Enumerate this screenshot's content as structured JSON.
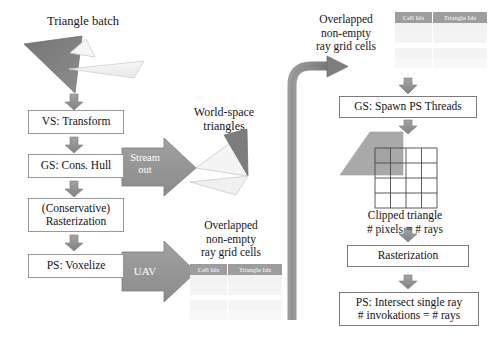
{
  "figure": {
    "title_left": "Triangle batch",
    "label_world_space": "World-space\ntriangles",
    "label_overlapped_bottom": "Overlapped\nnon-empty\nray grid cells",
    "label_overlapped_top": "Overlapped\nnon-empty\nray grid cells",
    "label_clipped": "Clipped triangle\n# pixels = # rays"
  },
  "left_pipeline": {
    "stages": [
      {
        "id": "vs-transform",
        "text": "VS: Transform"
      },
      {
        "id": "gs-cons-hull",
        "text": "GS: Cons. Hull"
      },
      {
        "id": "conservative-rasterization",
        "text": "(Conservative)\nRasterization"
      },
      {
        "id": "ps-voxelize",
        "text": "PS: Voxelize"
      }
    ]
  },
  "right_pipeline": {
    "stages": [
      {
        "id": "gs-spawn-ps-threads",
        "text": "GS: Spawn PS Threads"
      },
      {
        "id": "rasterization",
        "text": "Rasterization"
      },
      {
        "id": "ps-intersect-single-ray",
        "text": "PS: Intersect single ray\n# invokations = # rays"
      }
    ]
  },
  "block_arrows": {
    "stream_out": "Stream\nout",
    "uav": "UAV"
  },
  "tables": {
    "columns": [
      "Cell Idx",
      "Triangle Idx"
    ]
  },
  "colors": {
    "arrow_fill": "#8c8c8c",
    "arrow_stroke": "#6e6e6e",
    "block_arrow_fill": "#949494",
    "box_border": "#9a9a9a",
    "triangle_dark": "#6b6b6b",
    "triangle_mid": "#a8a8a8",
    "triangle_light": "#f2f2f2",
    "table_header": "#9d9d9d",
    "text": "#161616"
  }
}
